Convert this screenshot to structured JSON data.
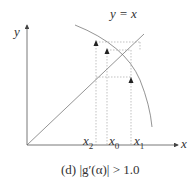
{
  "labels": {
    "y_axis": "y",
    "x_axis": "x",
    "line": "y = x",
    "x2": "x",
    "x2_sub": "2",
    "x0": "x",
    "x0_sub": "0",
    "x1": "x",
    "x1_sub": "1"
  },
  "caption": "(d) |g′(α)| > 1.0",
  "colors": {
    "stroke": "#555555",
    "dashed": "#999999"
  }
}
